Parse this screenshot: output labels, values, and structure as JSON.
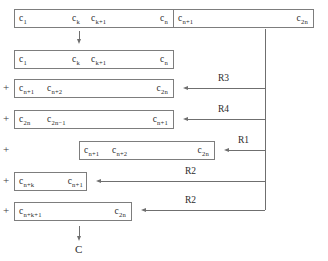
{
  "diagram": {
    "rows": [
      {
        "id": "row-1-left",
        "plus": "",
        "cells": [
          "c1",
          "ck",
          "ck+1",
          "cn"
        ],
        "cells_text": [
          "c₁",
          "c_k",
          "c_k+1",
          "c_n"
        ]
      },
      {
        "id": "row-1-right",
        "plus": "",
        "cells": [
          "cn+1",
          "c2n"
        ],
        "cells_text": [
          "c_n+1",
          "c_2n"
        ]
      },
      {
        "id": "row-2",
        "plus": "",
        "cells": [
          "c1",
          "ck",
          "ck+1",
          "cn"
        ],
        "cells_text": [
          "c₁",
          "c_k",
          "c_k+1",
          "c_n"
        ]
      },
      {
        "id": "row-3",
        "plus": "+",
        "cells": [
          "cn+1",
          "cn+2",
          "c2n"
        ],
        "cells_text": [
          "c_n+1",
          "c_n+2",
          "c_2n"
        ]
      },
      {
        "id": "row-4",
        "plus": "+",
        "cells": [
          "c2n",
          "c2n-1",
          "cn+1"
        ],
        "cells_text": [
          "c_2n",
          "c_2n−1",
          "c_n+1"
        ]
      },
      {
        "id": "row-5",
        "plus": "+",
        "cells": [
          "cn+1",
          "cn+2",
          "c2n"
        ],
        "cells_text": [
          "c_n+1",
          "c_n+2",
          "c_2n"
        ]
      },
      {
        "id": "row-6",
        "plus": "+",
        "cells": [
          "cn+k",
          "cn+1"
        ],
        "cells_text": [
          "c_n+k",
          "c_n+1"
        ]
      },
      {
        "id": "row-7",
        "plus": "+",
        "cells": [
          "cn+k+1",
          "c2n"
        ],
        "cells_text": [
          "c_n+k+1",
          "c_2n"
        ]
      }
    ],
    "labels": {
      "c1": "c",
      "c1_sub": "1",
      "ck": "c",
      "ck_sub": "k",
      "ckp1": "c",
      "ckp1_sub": "k+1",
      "cn": "c",
      "cn_sub": "n",
      "cnp1": "c",
      "cnp1_sub": "n+1",
      "cnp2": "c",
      "cnp2_sub": "n+2",
      "c2n": "c",
      "c2n_sub": "2n",
      "c2nm1": "c",
      "c2nm1_sub": "2n−1",
      "cnpk": "c",
      "cnpk_sub": "n+k",
      "cnpkp1": "c",
      "cnpkp1_sub": "n+k+1",
      "plus": "+"
    },
    "operations": [
      {
        "name": "R3",
        "label": "R3",
        "target_row": "row-3"
      },
      {
        "name": "R4",
        "label": "R4",
        "target_row": "row-4"
      },
      {
        "name": "R1",
        "label": "R1",
        "target_row": "row-5"
      },
      {
        "name": "R2a",
        "label": "R2",
        "target_row": "row-6"
      },
      {
        "name": "R2b",
        "label": "R2",
        "target_row": "row-7"
      }
    ],
    "output": {
      "label": "C"
    },
    "colors": {
      "border": "#7d7d7d",
      "line": "#6f6f6f",
      "text": "#2b2b2b",
      "background": "#ffffff"
    }
  }
}
